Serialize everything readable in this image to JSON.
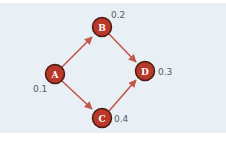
{
  "diagram": {
    "colors": {
      "background": "#e9f0f5",
      "node_fill": "#b8382a",
      "node_stroke": "#4a1a14",
      "edge": "#c2584a",
      "label_text": "#555b63"
    },
    "nodes": [
      {
        "id": "A",
        "label": "A",
        "value": "0.1",
        "x": 55,
        "y": 74
      },
      {
        "id": "B",
        "label": "B",
        "value": "0.2",
        "x": 102,
        "y": 27
      },
      {
        "id": "C",
        "label": "C",
        "value": "0.4",
        "x": 102,
        "y": 118
      },
      {
        "id": "D",
        "label": "D",
        "value": "0.3",
        "x": 145,
        "y": 71
      }
    ],
    "edges": [
      {
        "from": "A",
        "to": "B"
      },
      {
        "from": "A",
        "to": "C"
      },
      {
        "from": "B",
        "to": "D"
      },
      {
        "from": "C",
        "to": "D"
      }
    ]
  }
}
